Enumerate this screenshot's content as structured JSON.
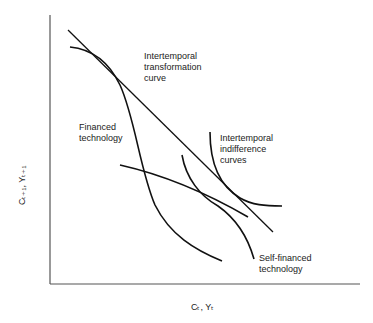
{
  "diagram": {
    "axes": {
      "x_label": "Cₜ, Yₜ",
      "y_label": "Cₜ₊₁, Yₜ₊₁"
    },
    "labels": {
      "transformation_curve": "Intertemporal\ntransformation\ncurve",
      "financed_technology": "Financed\ntechnology",
      "indifference_curves": "Intertemporal\nindifference\ncurves",
      "self_financed_technology": "Self-financed\ntechnology"
    },
    "colors": {
      "line": "#111111",
      "axis": "#555555",
      "background": "#ffffff"
    }
  }
}
